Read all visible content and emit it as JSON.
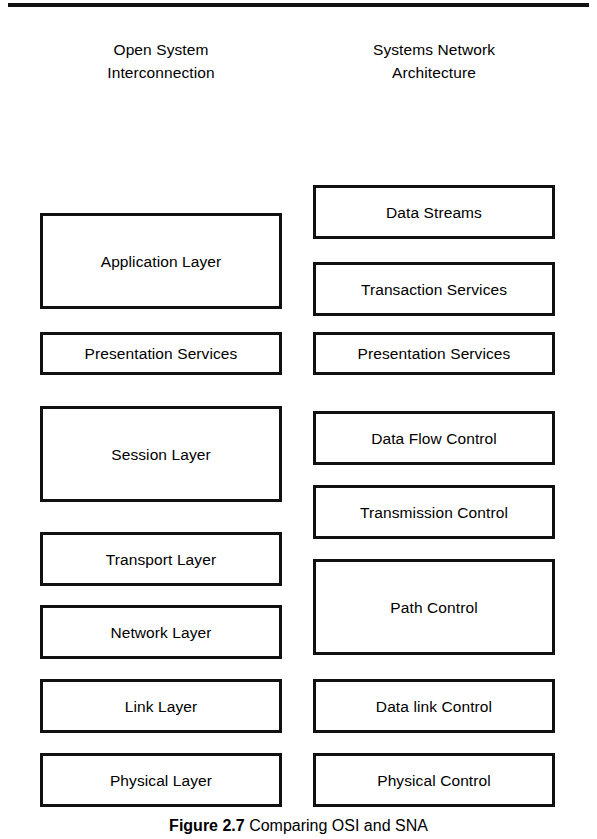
{
  "figure": {
    "top_rule": true,
    "caption_label": "Figure 2.7",
    "caption_text": "Comparing OSI and SNA",
    "colors": {
      "background": "#ffffff",
      "box_fill": "#ffffff",
      "box_border": "#111111",
      "box_shadow": "#111111",
      "text": "#000000"
    }
  },
  "columns": {
    "left": {
      "heading_line1": "Open System",
      "heading_line2": "Interconnection",
      "layers": [
        {
          "label": "Application Layer",
          "top": 213,
          "height": 96
        },
        {
          "label": "Presentation Services",
          "top": 332,
          "height": 43
        },
        {
          "label": "Session Layer",
          "top": 406,
          "height": 96
        },
        {
          "label": "Transport Layer",
          "top": 532,
          "height": 54
        },
        {
          "label": "Network Layer",
          "top": 605,
          "height": 54
        },
        {
          "label": "Link Layer",
          "top": 679,
          "height": 54
        },
        {
          "label": "Physical Layer",
          "top": 753,
          "height": 54
        }
      ]
    },
    "right": {
      "heading_line1": "Systems Network",
      "heading_line2": "Architecture",
      "layers": [
        {
          "label": "Data Streams",
          "top": 185,
          "height": 54
        },
        {
          "label": "Transaction Services",
          "top": 262,
          "height": 54
        },
        {
          "label": "Presentation Services",
          "top": 332,
          "height": 43
        },
        {
          "label": "Data Flow Control",
          "top": 411,
          "height": 54
        },
        {
          "label": "Transmission Control",
          "top": 485,
          "height": 54
        },
        {
          "label": "Path Control",
          "top": 559,
          "height": 96
        },
        {
          "label": "Data link Control",
          "top": 679,
          "height": 54
        },
        {
          "label": "Physical Control",
          "top": 753,
          "height": 54
        }
      ]
    }
  }
}
